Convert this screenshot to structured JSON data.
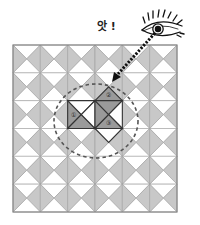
{
  "figure": {
    "exclamation": "앗 !",
    "grid": {
      "rows": 6,
      "cols": 6
    },
    "colors": {
      "tile_gray": "#c8c8c8",
      "tile_white": "#ffffff",
      "grid_line": "#a0a0a0",
      "highlight_gray": "#9a9a9a",
      "highlight_outline": "#333333",
      "arrow": "#111111",
      "dashed_circle": "#555555"
    },
    "markers": [
      {
        "label": "①",
        "cell": [
          2,
          2
        ],
        "triangle": "left"
      },
      {
        "label": "②",
        "cell": [
          3,
          1
        ],
        "triangle": "bottom"
      },
      {
        "label": "③",
        "cell": [
          3,
          2
        ],
        "triangle": "bottom"
      }
    ],
    "icons": [
      "eye-icon",
      "dotted-arrow-icon",
      "dashed-circle"
    ]
  }
}
